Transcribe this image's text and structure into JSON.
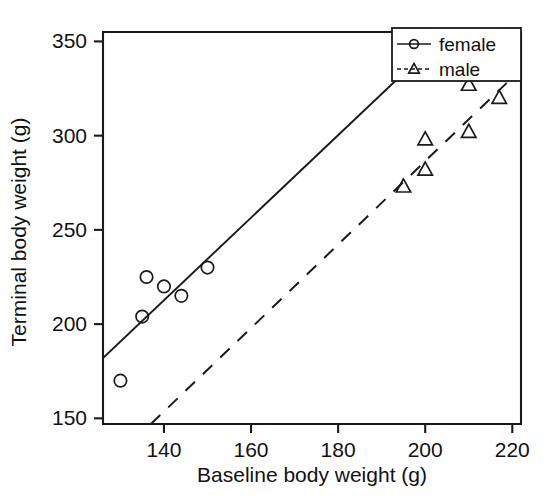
{
  "chart_data": {
    "type": "scatter",
    "title": "",
    "xlabel": "Baseline body weight (g)",
    "ylabel": "Terminal body weight (g)",
    "xlim": [
      126,
      222
    ],
    "ylim": [
      147,
      355
    ],
    "xticks": [
      140,
      160,
      180,
      200,
      220
    ],
    "xticklabels": [
      "140",
      "160",
      "180",
      "200",
      "220"
    ],
    "yticks": [
      150,
      200,
      250,
      300,
      350
    ],
    "yticklabels": [
      "150",
      "200",
      "250",
      "300",
      "350"
    ],
    "grid": false,
    "legend_position": "top-right",
    "series": [
      {
        "name": "female",
        "marker": "circle",
        "linestyle": "solid",
        "color": "#1a1a1a",
        "points": [
          {
            "x": 130,
            "y": 170
          },
          {
            "x": 135,
            "y": 204
          },
          {
            "x": 136,
            "y": 225
          },
          {
            "x": 140,
            "y": 220
          },
          {
            "x": 144,
            "y": 215
          },
          {
            "x": 150,
            "y": 230
          }
        ],
        "fit_line": {
          "x1": 126,
          "y1": 182,
          "x2": 205,
          "y2": 355
        }
      },
      {
        "name": "male",
        "marker": "triangle",
        "linestyle": "dashed",
        "color": "#1a1a1a",
        "points": [
          {
            "x": 195,
            "y": 273
          },
          {
            "x": 200,
            "y": 282
          },
          {
            "x": 200,
            "y": 298
          },
          {
            "x": 210,
            "y": 302
          },
          {
            "x": 210,
            "y": 327
          },
          {
            "x": 217,
            "y": 320
          }
        ],
        "fit_line": {
          "x1": 137,
          "y1": 147,
          "x2": 221,
          "y2": 333
        }
      }
    ]
  },
  "legend": {
    "entries": [
      {
        "label": "female"
      },
      {
        "label": "male"
      }
    ]
  },
  "axis": {
    "x_title": "Baseline body weight (g)",
    "y_title": "Terminal body weight (g)"
  }
}
